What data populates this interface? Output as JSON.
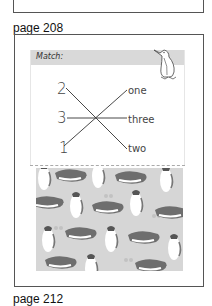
{
  "pages": [
    {
      "label": "page 208"
    },
    {
      "label": "page 212"
    }
  ],
  "worksheet": {
    "header": "Match:",
    "numbers": [
      "2",
      "3",
      "1"
    ],
    "words": [
      "one",
      "three",
      "two"
    ],
    "matches": [
      {
        "number": "2",
        "word": "two"
      },
      {
        "number": "3",
        "word": "three"
      },
      {
        "number": "1",
        "word": "one"
      }
    ]
  },
  "decorations": {
    "header_icon": "penguin-outline-icon",
    "pattern": "penguin-pattern"
  },
  "colors": {
    "frame_border": "#555555",
    "header_bg": "#d9d9d9",
    "pattern_bg": "#d6d6d6",
    "penguin_dark": "#6e6e6e",
    "text": "#444444"
  }
}
